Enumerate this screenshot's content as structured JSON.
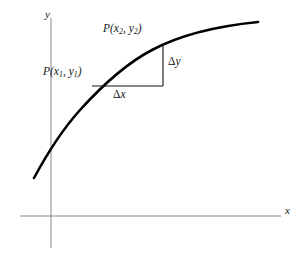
{
  "figure": {
    "background_color": "#ffffff",
    "curve_color": "#000000",
    "axis_color": "#888888",
    "annotation_color": "#151515"
  },
  "axes": {
    "x_label": "x",
    "y_label": "y",
    "origin": {
      "x": 51,
      "y": 216
    },
    "x_axis": {
      "x1": 20,
      "y1": 216,
      "x2": 281,
      "y2": 216
    },
    "y_axis": {
      "x1": 51,
      "y1": 18,
      "x2": 51,
      "y2": 248
    }
  },
  "curve": {
    "name": "increasing-concave-curve",
    "path": "M 34,178 C 48,152 62,130 80,110 C 100,88 125,64 152,50 C 180,35 218,26 258,22",
    "stroke_width": 2.6,
    "start_point": {
      "x": 34,
      "y": 178
    },
    "end_point": {
      "x": 258,
      "y": 22
    }
  },
  "points": [
    {
      "id": "p1",
      "label": "P(x₁, y₁)",
      "label_base": "P(x",
      "sub1": "1",
      "label_mid": ", y",
      "sub2": "1",
      "label_end": ")",
      "x": 92,
      "y": 86
    },
    {
      "id": "p2",
      "label": "P(x₂, y₂)",
      "label_base": "P(x",
      "sub1": "2",
      "label_mid": ", y",
      "sub2": "2",
      "label_end": ")",
      "x": 163,
      "y": 44
    }
  ],
  "step_triangle": {
    "horizontal_leg": {
      "x1": 92,
      "y1": 86,
      "x2": 163,
      "y2": 86
    },
    "vertical_leg": {
      "x1": 163,
      "y1": 86,
      "x2": 163,
      "y2": 44
    },
    "delta_x_label": "Δx",
    "delta_y_label": "Δy",
    "stroke_width": 1.1
  },
  "labels": {
    "delta_x": {
      "glyph": "Δ",
      "variable": "x"
    },
    "delta_y": {
      "glyph": "Δ",
      "variable": "y"
    }
  }
}
